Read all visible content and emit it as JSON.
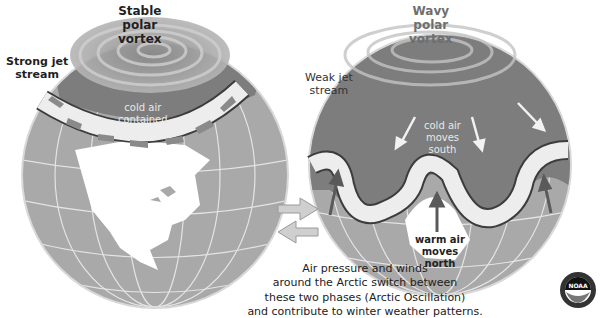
{
  "left_globe": {
    "title": [
      "Stable",
      "polar",
      "vortex"
    ],
    "jet_label": [
      "Strong jet",
      "stream"
    ],
    "air_label": [
      "cold air",
      "contained"
    ]
  },
  "right_globe": {
    "title": [
      "Wavy",
      "polar",
      "vortex"
    ],
    "jet_label": [
      "Weak jet",
      "stream"
    ],
    "cold_label": [
      "cold air",
      "moves",
      "south"
    ],
    "warm_label": [
      "warm air",
      "moves",
      "north"
    ]
  },
  "caption": [
    "Air pressure and winds",
    "around the Arctic switch between",
    "these two phases (Arctic Oscillation)",
    "and contribute to winter weather patterns."
  ],
  "logo": {
    "text": "NOAA"
  },
  "colors": {
    "ocean": "#a9a9a9",
    "land_light": "#ffffff",
    "polar_dark": "#7d7d7d",
    "jet_band": "#ededed",
    "arrow": "#8a8a8a"
  }
}
